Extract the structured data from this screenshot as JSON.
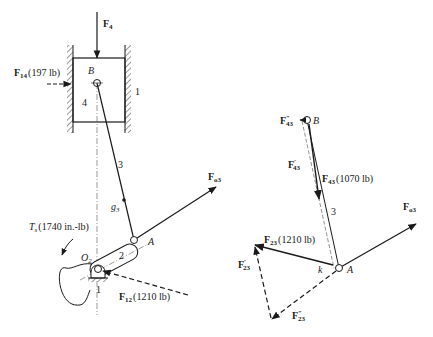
{
  "diagram": {
    "type": "slider-crank free-body force analysis",
    "left_figure": {
      "forces": {
        "F4": {
          "label": "F",
          "sub": "4"
        },
        "F14": {
          "label": "F",
          "sub": "14",
          "value": "(197 lb)"
        },
        "F12": {
          "label": "F",
          "sub": "12",
          "value": "(1210 lb)"
        },
        "Fo3": {
          "label": "F",
          "sub": "o3"
        }
      },
      "torque": {
        "label": "T",
        "sub": "s",
        "value": "(1740 in.-lb)"
      },
      "points": {
        "B": "B",
        "A": "A",
        "O2": "O",
        "O2_sub": "2",
        "g3": "g",
        "g3_sub": "3"
      },
      "links": {
        "frame_right": "1",
        "frame_bottom": "1",
        "piston": "4",
        "crank": "2",
        "rod": "3"
      }
    },
    "right_figure": {
      "forces": {
        "F43": {
          "label": "F",
          "sub": "43",
          "value": "(1070 lb)"
        },
        "F43_prime": {
          "label": "F",
          "prime": "′",
          "sub": "43"
        },
        "F43_dprime": {
          "label": "F",
          "prime": "″",
          "sub": "43"
        },
        "F23": {
          "label": "F",
          "sub": "23",
          "value": "(1210 lb)"
        },
        "F23_prime": {
          "label": "F",
          "prime": "′",
          "sub": "23"
        },
        "F23_dprime": {
          "label": "F",
          "prime": "″",
          "sub": "23"
        },
        "Fo3": {
          "label": "F",
          "sub": "o3"
        }
      },
      "points": {
        "B": "B",
        "A": "A",
        "k": "k"
      },
      "links": {
        "rod": "3"
      }
    },
    "colors": {
      "ink": "#1a1a1a",
      "hatch": "#333333"
    }
  }
}
